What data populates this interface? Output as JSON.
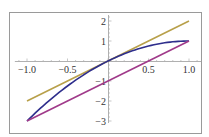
{
  "chart_data": {
    "type": "line",
    "title": "",
    "xlabel": "",
    "ylabel": "",
    "xlim": [
      -1.0,
      1.0
    ],
    "ylim": [
      -3,
      2
    ],
    "grid": false,
    "frame": true,
    "x_ticks": [
      "-1.0",
      "-0.5",
      "0.5",
      "1.0"
    ],
    "y_ticks": [
      "2",
      "1",
      "-1",
      "-2",
      "-3"
    ],
    "series": [
      {
        "name": "y = 2x",
        "color": "#b8a04a",
        "x": [
          -1,
          -0.5,
          0,
          0.5,
          1
        ],
        "values": [
          -2,
          -1,
          0,
          1,
          2
        ]
      },
      {
        "name": "y = 2x - x^2",
        "color": "#2e2e8c",
        "x": [
          -1,
          -0.75,
          -0.5,
          -0.25,
          0,
          0.25,
          0.5,
          0.75,
          1
        ],
        "values": [
          -3,
          -2.0625,
          -1.25,
          -0.5625,
          0,
          0.4375,
          0.75,
          0.9375,
          1
        ]
      },
      {
        "name": "y = 2x - 1",
        "color": "#a03a8a",
        "x": [
          -1,
          0,
          1
        ],
        "values": [
          -3,
          -1,
          1
        ]
      }
    ]
  }
}
